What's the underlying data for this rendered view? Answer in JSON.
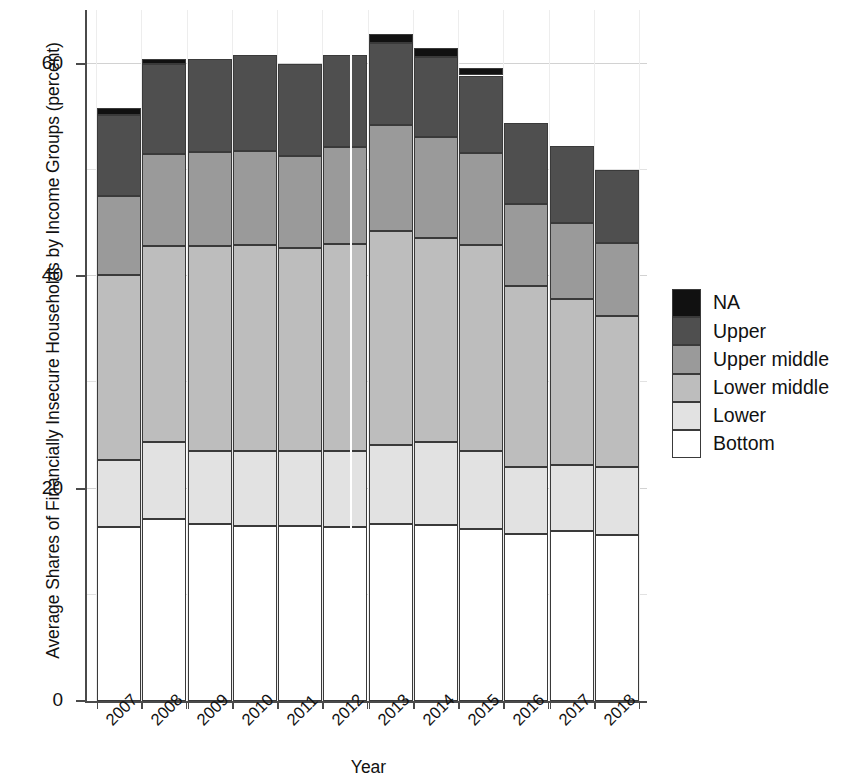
{
  "chart_data": {
    "type": "bar",
    "stacked": true,
    "title": "",
    "xlabel": "Year",
    "ylabel": "Average Shares of Financially Insecure Households by Income Groups (percent)",
    "categories": [
      "2007",
      "2008",
      "2009",
      "2010",
      "2011",
      "2012",
      "2013",
      "2014",
      "2015",
      "2016",
      "2017",
      "2018"
    ],
    "ylim": [
      0,
      66
    ],
    "yticks": [
      0,
      20,
      40,
      60
    ],
    "ytick_labels": [
      "0",
      "20",
      "40",
      "60"
    ],
    "grid": true,
    "legend_position": "right",
    "series": [
      {
        "name": "Bottom",
        "color": "#ffffff",
        "values": [
          16.4,
          17.1,
          16.7,
          16.5,
          16.5,
          16.4,
          16.7,
          16.6,
          16.2,
          15.7,
          16.0,
          15.6
        ]
      },
      {
        "name": "Lower",
        "color": "#e2e2e2",
        "values": [
          6.3,
          7.3,
          6.8,
          7.0,
          7.0,
          7.1,
          7.4,
          7.8,
          7.3,
          6.3,
          6.2,
          6.4
        ]
      },
      {
        "name": "Lower middle",
        "color": "#bdbdbd",
        "values": [
          17.4,
          18.4,
          19.3,
          19.4,
          19.2,
          19.5,
          20.2,
          19.2,
          19.4,
          17.1,
          15.7,
          14.3
        ]
      },
      {
        "name": "Upper middle",
        "color": "#9a9a9a",
        "values": [
          7.5,
          8.7,
          8.9,
          8.9,
          8.6,
          9.2,
          9.9,
          9.5,
          8.7,
          7.7,
          7.1,
          6.8
        ]
      },
      {
        "name": "Upper",
        "color": "#4f4f4f",
        "values": [
          7.6,
          8.5,
          8.8,
          9.0,
          8.7,
          8.6,
          7.8,
          7.5,
          7.3,
          7.6,
          7.3,
          6.9
        ]
      },
      {
        "name": "NA",
        "color": "#111111",
        "values": [
          0.6,
          0.5,
          0.0,
          0.0,
          0.0,
          0.0,
          0.8,
          0.9,
          0.7,
          0.0,
          0.0,
          0.0
        ]
      }
    ],
    "totals": [
      55.8,
      60.5,
      60.5,
      60.8,
      60.0,
      60.8,
      62.8,
      61.5,
      59.6,
      54.4,
      52.3,
      50.0
    ]
  },
  "legend": {
    "items": [
      {
        "label": "NA",
        "color": "#111111"
      },
      {
        "label": "Upper",
        "color": "#4f4f4f"
      },
      {
        "label": "Upper middle",
        "color": "#9a9a9a"
      },
      {
        "label": "Lower middle",
        "color": "#bdbdbd"
      },
      {
        "label": "Lower",
        "color": "#e2e2e2"
      },
      {
        "label": "Bottom",
        "color": "#ffffff"
      }
    ]
  }
}
